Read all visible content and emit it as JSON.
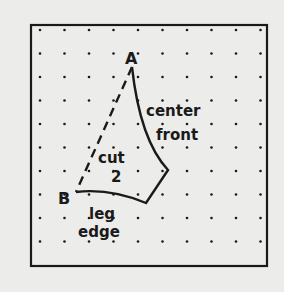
{
  "diagram": {
    "type": "sewing-pattern-piece",
    "colors": {
      "background": "#ececea",
      "ink": "#1a1a1a",
      "frame": "#1a1a1a"
    },
    "points": {
      "A": {
        "label": "A"
      },
      "B": {
        "label": "B"
      }
    },
    "labels": {
      "center": "center",
      "front": "front",
      "cut": "cut",
      "count": "2",
      "leg": "leg",
      "edge": "edge"
    },
    "grid": {
      "rows": 10,
      "cols": 10,
      "style": "dotted"
    }
  }
}
